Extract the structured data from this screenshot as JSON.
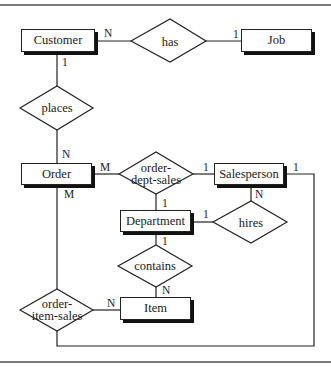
{
  "diagram": {
    "type": "entity-relationship",
    "entities": [
      {
        "id": "customer",
        "label": "Customer"
      },
      {
        "id": "job",
        "label": "Job"
      },
      {
        "id": "order",
        "label": "Order"
      },
      {
        "id": "salesperson",
        "label": "Salesperson"
      },
      {
        "id": "department",
        "label": "Department"
      },
      {
        "id": "item",
        "label": "Item"
      }
    ],
    "relationships": [
      {
        "id": "has",
        "label": "has",
        "from": "Customer",
        "from_card": "N",
        "to": "Job",
        "to_card": "1"
      },
      {
        "id": "places",
        "label": "places",
        "from": "Customer",
        "from_card": "1",
        "to": "Order",
        "to_card": "N"
      },
      {
        "id": "order-dept-sales",
        "label_line1": "order-",
        "label_line2": "dept-sales",
        "order_card": "M",
        "salesperson_card": "1",
        "department_card": "1"
      },
      {
        "id": "hires",
        "label": "hires",
        "from": "Department",
        "from_card": "1",
        "to": "Salesperson",
        "to_card": "N"
      },
      {
        "id": "contains",
        "label": "contains",
        "from": "Department",
        "from_card": "1",
        "to": "Item",
        "to_card": "N"
      },
      {
        "id": "order-item-sales",
        "label_line1": "order-",
        "label_line2": "item-sales",
        "order_card": "M",
        "item_card": "N",
        "salesperson_card": "1"
      }
    ],
    "cardinalities": {
      "customer_has": "N",
      "job_has": "1",
      "customer_places": "1",
      "order_places": "N",
      "order_ods": "M",
      "salesperson_ods": "1",
      "department_ods": "1",
      "salesperson_ois": "1",
      "salesperson_hires": "N",
      "department_hires": "1",
      "department_contains": "1",
      "item_contains": "N",
      "order_ois": "M",
      "item_ois": "N"
    }
  }
}
